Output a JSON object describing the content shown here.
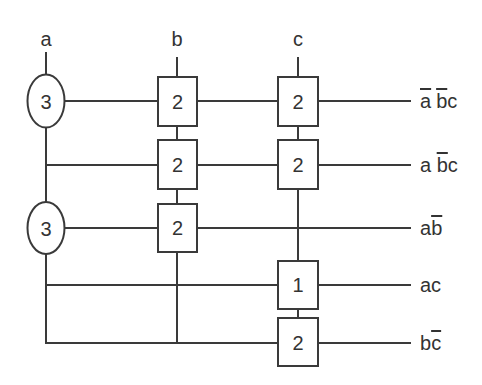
{
  "diagram": {
    "inputs": [
      {
        "name": "a",
        "x": 46
      },
      {
        "name": "b",
        "x": 177
      },
      {
        "name": "c",
        "x": 298
      }
    ],
    "nodes": [
      {
        "id": "a-node-1",
        "shape": "ellipse",
        "value": "3",
        "column": "a",
        "row": 1
      },
      {
        "id": "a-node-2",
        "shape": "ellipse",
        "value": "3",
        "column": "a",
        "row": 3
      },
      {
        "id": "b-node-1",
        "shape": "box",
        "value": "2",
        "column": "b",
        "row": 1
      },
      {
        "id": "b-node-2",
        "shape": "box",
        "value": "2",
        "column": "b",
        "row": 2
      },
      {
        "id": "b-node-3",
        "shape": "box",
        "value": "2",
        "column": "b",
        "row": 3
      },
      {
        "id": "c-node-1",
        "shape": "box",
        "value": "2",
        "column": "c",
        "row": 1
      },
      {
        "id": "c-node-2",
        "shape": "box",
        "value": "2",
        "column": "c",
        "row": 2
      },
      {
        "id": "c-node-4",
        "shape": "box",
        "value": "1",
        "column": "c",
        "row": 4
      },
      {
        "id": "c-node-5",
        "shape": "box",
        "value": "2",
        "column": "c",
        "row": 5
      }
    ],
    "outputs": [
      {
        "row": 1,
        "terms": [
          {
            "t": "a",
            "bar": true
          },
          {
            "t": " ",
            "bar": false
          },
          {
            "t": "b",
            "bar": true
          },
          {
            "t": "c",
            "bar": false
          }
        ],
        "text": "a̅ b̅c"
      },
      {
        "row": 2,
        "terms": [
          {
            "t": "a ",
            "bar": false
          },
          {
            "t": "b",
            "bar": true
          },
          {
            "t": "c",
            "bar": false
          }
        ],
        "text": "a b̅c"
      },
      {
        "row": 3,
        "terms": [
          {
            "t": "a",
            "bar": false
          },
          {
            "t": "b",
            "bar": true
          }
        ],
        "text": "ab̅"
      },
      {
        "row": 4,
        "terms": [
          {
            "t": "ac",
            "bar": false
          }
        ],
        "text": "ac"
      },
      {
        "row": 5,
        "terms": [
          {
            "t": "b",
            "bar": false
          },
          {
            "t": "c",
            "bar": true
          }
        ],
        "text": "bc̅"
      }
    ],
    "colors": {
      "line": "#3a3a3a",
      "text": "#333333",
      "background": "#ffffff"
    }
  },
  "labels": {
    "in_a": "a",
    "in_b": "b",
    "in_c": "c",
    "n_a1": "3",
    "n_a2": "3",
    "n_b1": "2",
    "n_b2": "2",
    "n_b3": "2",
    "n_c1": "2",
    "n_c2": "2",
    "n_c4": "1",
    "n_c5": "2"
  },
  "out": {
    "r1": {
      "p1": "a",
      "p2": " ",
      "p3": "b",
      "p4": "c"
    },
    "r2": {
      "p1": "a ",
      "p2": "b",
      "p3": "c"
    },
    "r3": {
      "p1": "a",
      "p2": "b"
    },
    "r4": {
      "p1": "ac"
    },
    "r5": {
      "p1": "b",
      "p2": "c"
    }
  }
}
